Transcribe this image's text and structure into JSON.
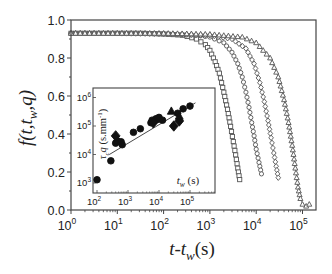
{
  "chart_data": [
    {
      "id": "main",
      "type": "scatter",
      "title": "",
      "xlabel": "t-t_w(s)",
      "ylabel": "f(t,t_w,q)",
      "xscale": "log",
      "yscale": "linear",
      "xlim": [
        1,
        200000
      ],
      "ylim": [
        0.0,
        1.0
      ],
      "grid": false,
      "legend": null,
      "x_ticks": [
        "10^0",
        "10^1",
        "10^2",
        "10^3",
        "10^4",
        "10^5"
      ],
      "y_ticks": [
        "0.0",
        "0.2",
        "0.4",
        "0.6",
        "0.8",
        "1.0"
      ],
      "plateau": 0.93,
      "series": [
        {
          "name": "squares",
          "marker": "square",
          "filled": false,
          "line": true,
          "x": [
            1,
            2,
            4,
            8,
            16,
            32,
            64,
            128,
            256,
            512,
            800,
            1000,
            1300,
            1600,
            2000,
            2400,
            2800,
            3200,
            3600,
            4000,
            4400
          ],
          "y": [
            0.93,
            0.93,
            0.93,
            0.93,
            0.93,
            0.93,
            0.928,
            0.925,
            0.92,
            0.9,
            0.87,
            0.84,
            0.78,
            0.72,
            0.62,
            0.53,
            0.44,
            0.36,
            0.29,
            0.22,
            0.16
          ]
        },
        {
          "name": "circles",
          "marker": "circle",
          "filled": false,
          "line": true,
          "x": [
            1,
            10,
            100,
            500,
            1000,
            2000,
            3000,
            4000,
            5000,
            6000,
            7000,
            8000,
            9000,
            10000,
            11500,
            13000
          ],
          "y": [
            0.93,
            0.93,
            0.927,
            0.92,
            0.91,
            0.88,
            0.83,
            0.77,
            0.7,
            0.62,
            0.54,
            0.46,
            0.39,
            0.32,
            0.25,
            0.19
          ]
        },
        {
          "name": "diamonds",
          "marker": "diamond",
          "filled": false,
          "line": true,
          "x": [
            1,
            10,
            100,
            1000,
            3000,
            6000,
            9000,
            12000,
            15000,
            18000,
            21000,
            24000,
            27000,
            30000
          ],
          "y": [
            0.93,
            0.93,
            0.928,
            0.92,
            0.9,
            0.85,
            0.77,
            0.67,
            0.57,
            0.47,
            0.38,
            0.3,
            0.23,
            0.17
          ]
        },
        {
          "name": "triangles",
          "marker": "triangle",
          "filled": false,
          "line": true,
          "x": [
            1,
            10,
            100,
            1000,
            5000,
            10000,
            20000,
            30000,
            40000,
            50000,
            60000,
            70000,
            80000,
            90000,
            100000,
            120000,
            140000
          ],
          "y": [
            0.93,
            0.93,
            0.93,
            0.925,
            0.91,
            0.88,
            0.8,
            0.7,
            0.58,
            0.46,
            0.34,
            0.22,
            0.12,
            0.06,
            0.03,
            0.02,
            0.03
          ]
        }
      ]
    },
    {
      "id": "inset",
      "type": "scatter",
      "title": "",
      "xlabel": "t_w (s)",
      "ylabel": "τ_c q (s.mm^-1)",
      "xscale": "log",
      "yscale": "log",
      "xlim": [
        70,
        250000
      ],
      "ylim": [
        400,
        3000000
      ],
      "grid": false,
      "x_ticks": [
        "10^2",
        "10^3",
        "10^4",
        "10^5"
      ],
      "y_ticks": [
        "10^3",
        "10^4",
        "10^5",
        "10^6"
      ],
      "fit_line": {
        "x": [
          250,
          150000
        ],
        "y": [
          10000,
          650000
        ]
      },
      "series": [
        {
          "name": "circles",
          "marker": "circle",
          "filled": true,
          "x": [
            100,
            280,
            400,
            450,
            600,
            650,
            1500,
            2500,
            5500,
            6000,
            7000,
            8000,
            9000,
            10000,
            13000,
            40000,
            60000,
            100000
          ],
          "y": [
            1300,
            6000,
            25000,
            30000,
            28000,
            22000,
            60000,
            80000,
            130000,
            160000,
            150000,
            180000,
            170000,
            200000,
            160000,
            280000,
            400000,
            500000
          ]
        },
        {
          "name": "diamonds",
          "marker": "diamond",
          "filled": true,
          "x": [
            400,
            6500,
            30000,
            45000
          ],
          "y": [
            45000,
            130000,
            100000,
            150000
          ],
          "size": 4
        },
        {
          "name": "triangles",
          "marker": "triangle",
          "filled": true,
          "x": [
            25000,
            45000
          ],
          "y": [
            330000,
            220000
          ]
        }
      ]
    }
  ],
  "labels": {
    "main_ylabel": {
      "f": "f",
      "rest": "(t,t",
      "sub": "w",
      "tail": ",q)"
    },
    "main_xlabel": {
      "t": "t-t",
      "sub": "w",
      "tail": "(s)"
    },
    "inset_xlabel": {
      "t": "t",
      "sub": "w",
      "tail": " (s)"
    },
    "inset_ylabel": {
      "tau": "τ",
      "sub": "c",
      "q": "q",
      "units": " (s.mm",
      "sup": "-1",
      "close": ")"
    }
  }
}
